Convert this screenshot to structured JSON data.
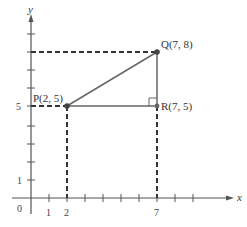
{
  "diagram": {
    "axes": {
      "x_label": "x",
      "y_label": "y",
      "origin_label": "0",
      "x_tick_labels": [
        "1",
        "2",
        "7"
      ],
      "y_tick_labels": [
        "1",
        "5"
      ]
    },
    "points": {
      "P": {
        "label": "P(2, 5)",
        "x": 2,
        "y": 5
      },
      "Q": {
        "label": "Q(7, 8)",
        "x": 7,
        "y": 8
      },
      "R": {
        "label": "R(7, 5)",
        "x": 7,
        "y": 5
      }
    },
    "colors": {
      "axis": "#555555",
      "segment": "#666666",
      "dashed": "#333333",
      "point": "#444444"
    }
  }
}
